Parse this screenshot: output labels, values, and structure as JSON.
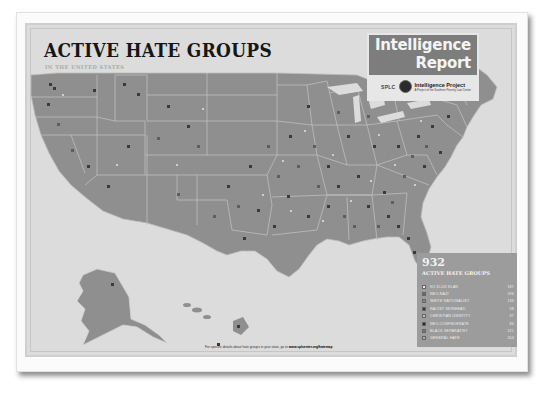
{
  "poster": {
    "title": "ACTIVE HATE GROUPS",
    "subtitle": "IN THE UNITED STATES",
    "caption_prefix": "For specific details about hate groups in your state, go to",
    "caption_url": "www.splcenter.org/hatemap"
  },
  "branding": {
    "line1": "Intelligence",
    "line2": "Report",
    "org_short": "SPLC",
    "project_name": "Intelligence Project",
    "project_sub": "A Project of the Southern Poverty Law Center"
  },
  "legend": {
    "total": "932",
    "label": "ACTIVE HATE GROUPS",
    "items": [
      {
        "name": "KU KLUX KLAN",
        "count": "187",
        "color": "#e8e8e8",
        "icon": "klan-hood-icon"
      },
      {
        "name": "NEO-NAZI",
        "count": "196",
        "color": "#6a6a6a",
        "icon": "square-icon"
      },
      {
        "name": "WHITE NATIONALIST",
        "count": "136",
        "color": "#8a8a8a",
        "icon": "square-icon"
      },
      {
        "name": "RACIST SKINHEAD",
        "count": "98",
        "color": "#3a3a3a",
        "icon": "square-icon"
      },
      {
        "name": "CHRISTIAN IDENTITY",
        "count": "37",
        "color": "#bdbdbd",
        "icon": "square-icon"
      },
      {
        "name": "NEO-CONFEDERATE",
        "count": "86",
        "color": "#222222",
        "icon": "square-icon"
      },
      {
        "name": "BLACK SEPARATIST",
        "count": "121",
        "color": "#777777",
        "icon": "square-icon"
      },
      {
        "name": "GENERAL HATE",
        "count": "204",
        "color": "#a8a8a8",
        "icon": "square-icon"
      }
    ]
  },
  "map": {
    "land_color": "#8f8f8f",
    "border_color": "#c8c8c8",
    "water_color": "#dcdcdc",
    "regions": [
      "contiguous-us",
      "alaska",
      "hawaii"
    ]
  }
}
